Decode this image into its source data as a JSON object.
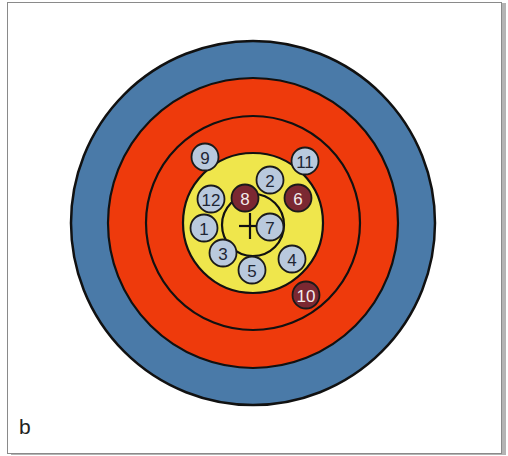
{
  "figure": {
    "panel_label": "b",
    "center": {
      "x": 253,
      "y": 223
    },
    "colors": {
      "outer_blue": "#4a7aa8",
      "red": "#ee3a0c",
      "yellow": "#efe64c",
      "ring_line": "#111111",
      "marker_light_fill": "#b9c9dd",
      "marker_light_text": "#1e2533",
      "marker_dark_fill": "#7b2832",
      "marker_dark_text": "#f4ecec"
    },
    "rings": [
      {
        "name": "blue-ring",
        "radius": 182,
        "fill": "#4a7aa8"
      },
      {
        "name": "red-ring-outer",
        "radius": 145,
        "fill": "#ee3a0c"
      },
      {
        "name": "red-ring-inner",
        "radius": 107,
        "fill": "#ee3a0c"
      },
      {
        "name": "yellow-ring",
        "radius": 70,
        "fill": "#efe64c"
      },
      {
        "name": "inner-ring",
        "radius": 31,
        "fill": "none"
      }
    ],
    "crosshair": {
      "x": 250,
      "y": 226,
      "half_length": 13
    },
    "markers": [
      {
        "label": "1",
        "x": 204,
        "y": 228,
        "type": "light"
      },
      {
        "label": "2",
        "x": 270,
        "y": 180,
        "type": "light"
      },
      {
        "label": "3",
        "x": 223,
        "y": 253,
        "type": "light"
      },
      {
        "label": "4",
        "x": 292,
        "y": 259,
        "type": "light"
      },
      {
        "label": "5",
        "x": 252,
        "y": 270,
        "type": "light"
      },
      {
        "label": "6",
        "x": 298,
        "y": 198,
        "type": "dark"
      },
      {
        "label": "7",
        "x": 270,
        "y": 227,
        "type": "light"
      },
      {
        "label": "8",
        "x": 245,
        "y": 198,
        "type": "dark"
      },
      {
        "label": "9",
        "x": 205,
        "y": 157,
        "type": "light"
      },
      {
        "label": "10",
        "x": 306,
        "y": 295,
        "type": "dark"
      },
      {
        "label": "11",
        "x": 305,
        "y": 161,
        "type": "light"
      },
      {
        "label": "12",
        "x": 211,
        "y": 199,
        "type": "light"
      }
    ],
    "marker_radius": 13.5
  }
}
